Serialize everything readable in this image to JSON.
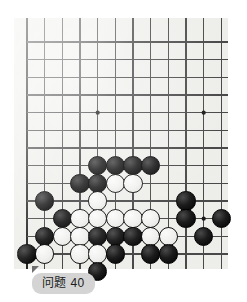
{
  "diagram": {
    "kind": "go-board-problem",
    "caption": "问题 40",
    "board": {
      "background_color": "#f2f2ef",
      "line_color": "#4a4a4a",
      "edge_line_color": "#222222",
      "origin_x": 13,
      "origin_y": 24,
      "spacing": 17.67,
      "cols": 12,
      "rows": 13,
      "left_edge_col": 0,
      "bottom_edge_row": 13,
      "star_points": [
        {
          "col": 4,
          "row": 4
        },
        {
          "col": 10,
          "row": 4
        },
        {
          "col": 10,
          "row": 10
        }
      ]
    },
    "stones": [
      {
        "color": "black",
        "col": 4,
        "row": 7
      },
      {
        "color": "black",
        "col": 5,
        "row": 7
      },
      {
        "color": "black",
        "col": 6,
        "row": 7
      },
      {
        "color": "black",
        "col": 7,
        "row": 7
      },
      {
        "color": "black",
        "col": 3,
        "row": 8
      },
      {
        "color": "black",
        "col": 4,
        "row": 8
      },
      {
        "color": "white",
        "col": 5,
        "row": 8
      },
      {
        "color": "white",
        "col": 6,
        "row": 8
      },
      {
        "color": "black",
        "col": 1,
        "row": 9
      },
      {
        "color": "white",
        "col": 4,
        "row": 9
      },
      {
        "color": "black",
        "col": 9,
        "row": 9
      },
      {
        "color": "black",
        "col": 2,
        "row": 10
      },
      {
        "color": "white",
        "col": 3,
        "row": 10
      },
      {
        "color": "white",
        "col": 4,
        "row": 10
      },
      {
        "color": "white",
        "col": 5,
        "row": 10
      },
      {
        "color": "white",
        "col": 6,
        "row": 10
      },
      {
        "color": "white",
        "col": 7,
        "row": 10
      },
      {
        "color": "black",
        "col": 9,
        "row": 10
      },
      {
        "color": "black",
        "col": 11,
        "row": 10
      },
      {
        "color": "black",
        "col": 1,
        "row": 11
      },
      {
        "color": "white",
        "col": 2,
        "row": 11
      },
      {
        "color": "white",
        "col": 3,
        "row": 11
      },
      {
        "color": "black",
        "col": 4,
        "row": 11
      },
      {
        "color": "black",
        "col": 5,
        "row": 11
      },
      {
        "color": "black",
        "col": 6,
        "row": 11
      },
      {
        "color": "white",
        "col": 7,
        "row": 11
      },
      {
        "color": "white",
        "col": 8,
        "row": 11
      },
      {
        "color": "black",
        "col": 10,
        "row": 11
      },
      {
        "color": "black",
        "col": 0,
        "row": 12
      },
      {
        "color": "white",
        "col": 1,
        "row": 12
      },
      {
        "color": "white",
        "col": 3,
        "row": 12
      },
      {
        "color": "white",
        "col": 4,
        "row": 12
      },
      {
        "color": "black",
        "col": 5,
        "row": 12
      },
      {
        "color": "black",
        "col": 7,
        "row": 12
      },
      {
        "color": "black",
        "col": 8,
        "row": 12
      },
      {
        "color": "black",
        "col": 4,
        "row": 13
      }
    ],
    "stone_radius": 9.6
  }
}
